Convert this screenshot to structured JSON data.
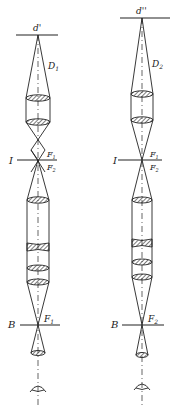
{
  "diagram": {
    "type": "optical-schematic",
    "colors": {
      "ink": "#222222",
      "background": "#ffffff"
    },
    "columns": [
      {
        "id": "left",
        "axis_x": 38,
        "labels": {
          "object": "d'",
          "diameter": "D",
          "diameter_sub": "1",
          "intermediate_plane": "I",
          "focus_top": "F",
          "focus_top_sub": "1",
          "focus_bottom": "F",
          "focus_bottom_sub": "2",
          "back_plane": "B",
          "back_focus": "F",
          "back_focus_sub": "1"
        }
      },
      {
        "id": "right",
        "axis_x": 142,
        "labels": {
          "object": "d''",
          "diameter": "D",
          "diameter_sub": "2",
          "intermediate_plane": "I",
          "focus_top": "F",
          "focus_top_sub": "1",
          "focus_bottom": "F",
          "focus_bottom_sub": "2",
          "back_plane": "B",
          "back_focus": "F",
          "back_focus_sub": "2"
        }
      }
    ]
  }
}
